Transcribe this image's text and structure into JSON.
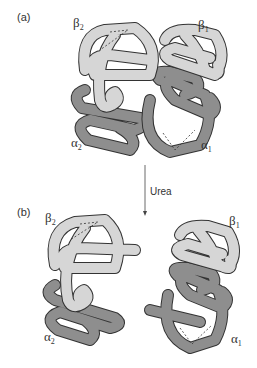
{
  "figure": {
    "panel_a": {
      "label": "(a)",
      "subunits": {
        "beta2": {
          "symbol": "β",
          "sub": "2"
        },
        "beta1": {
          "symbol": "β",
          "sub": "1"
        },
        "alpha2": {
          "symbol": "α",
          "sub": "2"
        },
        "alpha1": {
          "symbol": "α",
          "sub": "1"
        }
      }
    },
    "arrow": {
      "label": "Urea"
    },
    "panel_b": {
      "label": "(b)",
      "subunits": {
        "beta2": {
          "symbol": "β",
          "sub": "2"
        },
        "beta1": {
          "symbol": "β",
          "sub": "1"
        },
        "alpha2": {
          "symbol": "α",
          "sub": "2"
        },
        "alpha1": {
          "symbol": "α",
          "sub": "1"
        }
      }
    },
    "colors": {
      "beta_chain": "#d6d6d6",
      "alpha_chain": "#8e8e8e",
      "outline": "#333333",
      "background": "#ffffff"
    }
  }
}
